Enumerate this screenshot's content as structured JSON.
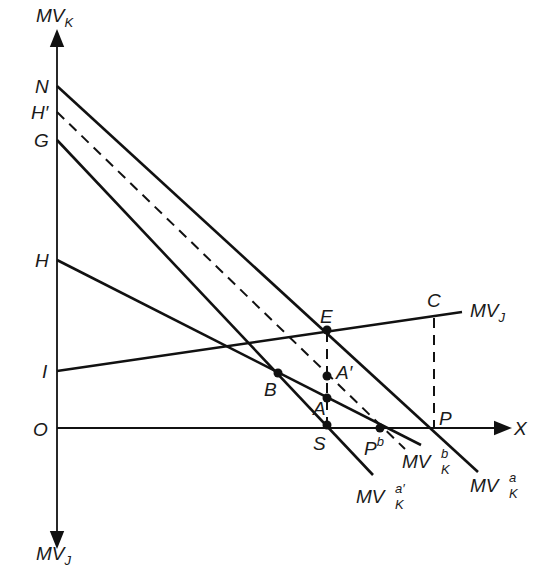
{
  "diagram": {
    "axes": {
      "y_up_label": "MV",
      "y_up_sub": "K",
      "y_down_label": "MV",
      "y_down_sub": "J",
      "x_label": "X",
      "origin": "O"
    },
    "axis_points": {
      "N": "N",
      "H_prime": "H′",
      "G": "G",
      "H": "H",
      "I": "I"
    },
    "points": {
      "E": "E",
      "C": "C",
      "A_prime": "A′",
      "A": "A",
      "B": "B",
      "S": "S",
      "P": "P",
      "Pb": "P",
      "Pb_sup": "b"
    },
    "curves": {
      "mvj": {
        "label": "MV",
        "sub": "J"
      },
      "mvk_a": {
        "label": "MV",
        "sub": "K",
        "sup": "a"
      },
      "mvk_b": {
        "label": "MV",
        "sub": "K",
        "sup": "b"
      },
      "mvk_a_prime": {
        "label": "MV",
        "sub": "K",
        "sup": "a′"
      }
    },
    "line_color": "#111111",
    "background": "#ffffff"
  }
}
